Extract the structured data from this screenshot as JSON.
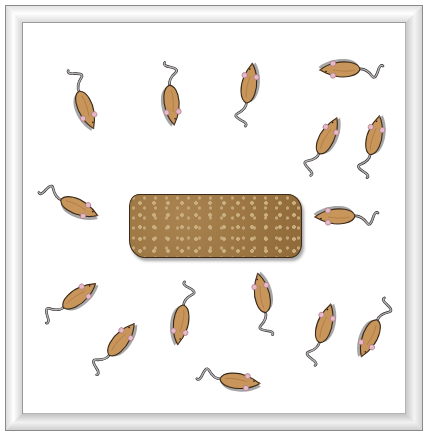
{
  "scene": {
    "description": "Illustration of mice gathered around a rectangular food block inside a beveled white-framed enclosure (top view)",
    "colors": {
      "frame_light": "#ffffff",
      "frame_shade": "#cfcfcf",
      "frame_edge": "#8a8a8a",
      "background": "#ffffff",
      "mouse_body": "#c8955a",
      "mouse_outline": "#3a2a1a",
      "mouse_ear": "#e7b8c6",
      "mouse_tail": "#8d8d8d",
      "food_block": "#9c7540",
      "food_dots": "#c9ae80"
    },
    "food_block": {
      "label": "food-pellet-block",
      "x": 129,
      "y": 194,
      "width": 171,
      "height": 62
    },
    "mouse_count": 15,
    "mice": [
      {
        "id": 1,
        "x": 85,
        "y": 105,
        "rotation": 70
      },
      {
        "id": 2,
        "x": 172,
        "y": 100,
        "rotation": 85
      },
      {
        "id": 3,
        "x": 248,
        "y": 88,
        "rotation": -80
      },
      {
        "id": 4,
        "x": 345,
        "y": 70,
        "rotation": 180
      },
      {
        "id": 5,
        "x": 325,
        "y": 140,
        "rotation": -62
      },
      {
        "id": 6,
        "x": 373,
        "y": 140,
        "rotation": -75
      },
      {
        "id": 7,
        "x": 75,
        "y": 205,
        "rotation": 25
      },
      {
        "id": 8,
        "x": 340,
        "y": 217,
        "rotation": 180
      },
      {
        "id": 9,
        "x": 75,
        "y": 298,
        "rotation": -35
      },
      {
        "id": 10,
        "x": 118,
        "y": 343,
        "rotation": -50
      },
      {
        "id": 11,
        "x": 182,
        "y": 320,
        "rotation": 100
      },
      {
        "id": 12,
        "x": 262,
        "y": 298,
        "rotation": -100
      },
      {
        "id": 13,
        "x": 323,
        "y": 328,
        "rotation": -72
      },
      {
        "id": 14,
        "x": 372,
        "y": 334,
        "rotation": 115
      },
      {
        "id": 15,
        "x": 235,
        "y": 380,
        "rotation": 8
      }
    ]
  }
}
